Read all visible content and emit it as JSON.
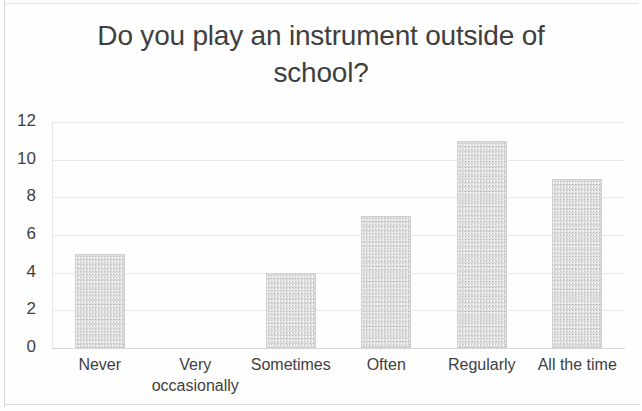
{
  "chart_data": {
    "type": "bar",
    "title": "Do you play an instrument outside of\nschool?",
    "categories": [
      "Never",
      "Very\noccasionally",
      "Sometimes",
      "Often",
      "Regularly",
      "All the time"
    ],
    "values": [
      5,
      0,
      4,
      7,
      11,
      9
    ],
    "xlabel": "",
    "ylabel": "",
    "ylim": [
      0,
      12
    ],
    "yticks": [
      "0",
      "2",
      "4",
      "6",
      "8",
      "10",
      "12"
    ],
    "ytick_values": [
      0,
      2,
      4,
      6,
      8,
      10,
      12
    ],
    "grid": true,
    "legend": false,
    "series_color": "#dedede",
    "text_color": "#3f3f3f",
    "gridline_color": "#e8e8e8"
  }
}
